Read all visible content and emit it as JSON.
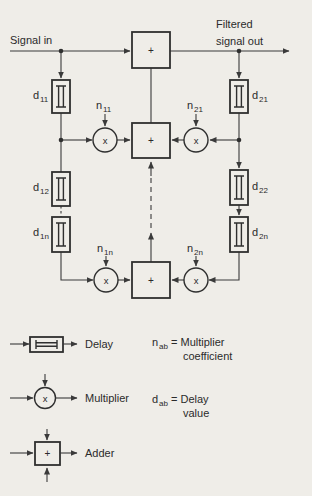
{
  "colors": {
    "background": "#efede8",
    "line": "#3a3a3a",
    "text": "#2b2b2b"
  },
  "labels": {
    "signal_in": "Signal in",
    "filtered_line1": "Filtered",
    "filtered_line2": "signal out"
  },
  "symbols": {
    "plus": "+",
    "times": "x"
  },
  "delays": {
    "d11": {
      "base": "d",
      "sub": "11"
    },
    "d12": {
      "base": "d",
      "sub": "12"
    },
    "d1n": {
      "base": "d",
      "sub": "1n"
    },
    "d21": {
      "base": "d",
      "sub": "21"
    },
    "d22": {
      "base": "d",
      "sub": "22"
    },
    "d2n": {
      "base": "d",
      "sub": "2n"
    }
  },
  "coefficients": {
    "n11": {
      "base": "n",
      "sub": "11"
    },
    "n21": {
      "base": "n",
      "sub": "21"
    },
    "n1n": {
      "base": "n",
      "sub": "1n"
    },
    "n2n": {
      "base": "n",
      "sub": "2n"
    }
  },
  "legend": {
    "delay": "Delay",
    "multiplier": "Multiplier",
    "adder": "Adder",
    "n_ab": {
      "base": "n",
      "sub": "ab",
      "rest": "= Multiplier",
      "line2": "coefficient"
    },
    "d_ab": {
      "base": "d",
      "sub": "ab",
      "rest": "= Delay",
      "line2": "value"
    }
  }
}
